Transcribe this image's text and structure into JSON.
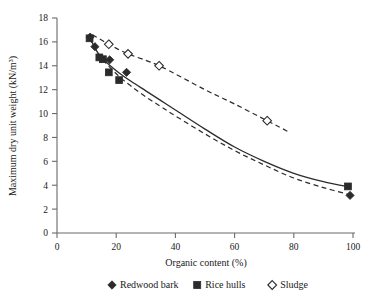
{
  "chart_data": {
    "type": "scatter",
    "title": "",
    "xlabel": "Organic content (%)",
    "ylabel": "Maximum dry unit weight (kN/m³)",
    "xlim": [
      0,
      100
    ],
    "ylim": [
      0,
      18
    ],
    "xticks": [
      0,
      20,
      40,
      60,
      80,
      100
    ],
    "yticks": [
      0,
      2,
      4,
      6,
      8,
      10,
      12,
      14,
      16,
      18
    ],
    "grid": false,
    "legend_position": "bottom",
    "series": [
      {
        "name": "Redwood bark",
        "marker": "filled-diamond",
        "color": "#2b2b2b",
        "points": [
          {
            "x": 11.2,
            "y": 16.4
          },
          {
            "x": 12.8,
            "y": 15.6
          },
          {
            "x": 15.0,
            "y": 14.6
          },
          {
            "x": 17.8,
            "y": 14.5
          },
          {
            "x": 23.5,
            "y": 13.45
          },
          {
            "x": 99.0,
            "y": 3.15
          }
        ]
      },
      {
        "name": "Rice hulls",
        "marker": "filled-square",
        "color": "#2b2b2b",
        "points": [
          {
            "x": 11.0,
            "y": 16.3
          },
          {
            "x": 14.3,
            "y": 14.7
          },
          {
            "x": 15.5,
            "y": 14.55
          },
          {
            "x": 17.5,
            "y": 13.45
          },
          {
            "x": 21.0,
            "y": 12.8
          },
          {
            "x": 98.3,
            "y": 3.9
          }
        ]
      },
      {
        "name": "Sludge",
        "marker": "open-diamond",
        "color": "#ffffff",
        "points": [
          {
            "x": 17.5,
            "y": 15.8
          },
          {
            "x": 24.0,
            "y": 15.0
          },
          {
            "x": 34.5,
            "y": 14.0
          },
          {
            "x": 71.0,
            "y": 9.4
          }
        ]
      }
    ],
    "fit_curves": [
      {
        "name": "organics-fit-solid",
        "style": "solid",
        "points": [
          {
            "x": 11.0,
            "y": 16.4
          },
          {
            "x": 13.0,
            "y": 15.4
          },
          {
            "x": 15.0,
            "y": 14.7
          },
          {
            "x": 18.0,
            "y": 14.0
          },
          {
            "x": 21.0,
            "y": 13.4
          },
          {
            "x": 25.0,
            "y": 12.7
          },
          {
            "x": 30.0,
            "y": 11.9
          },
          {
            "x": 35.0,
            "y": 11.1
          },
          {
            "x": 40.0,
            "y": 10.3
          },
          {
            "x": 50.0,
            "y": 8.7
          },
          {
            "x": 60.0,
            "y": 7.2
          },
          {
            "x": 70.0,
            "y": 6.0
          },
          {
            "x": 80.0,
            "y": 5.0
          },
          {
            "x": 90.0,
            "y": 4.3
          },
          {
            "x": 99.0,
            "y": 3.85
          }
        ]
      },
      {
        "name": "organics-fit-dashed",
        "style": "dashed",
        "points": [
          {
            "x": 11.0,
            "y": 16.3
          },
          {
            "x": 14.0,
            "y": 15.0
          },
          {
            "x": 17.0,
            "y": 14.1
          },
          {
            "x": 21.0,
            "y": 13.1
          },
          {
            "x": 25.0,
            "y": 12.3
          },
          {
            "x": 30.0,
            "y": 11.4
          },
          {
            "x": 35.0,
            "y": 10.6
          },
          {
            "x": 40.0,
            "y": 9.8
          },
          {
            "x": 50.0,
            "y": 8.3
          },
          {
            "x": 60.0,
            "y": 6.9
          },
          {
            "x": 70.0,
            "y": 5.7
          },
          {
            "x": 80.0,
            "y": 4.6
          },
          {
            "x": 90.0,
            "y": 3.8
          },
          {
            "x": 99.0,
            "y": 3.2
          }
        ]
      },
      {
        "name": "sludge-fit-dashed",
        "style": "dashed",
        "points": [
          {
            "x": 12.0,
            "y": 16.6
          },
          {
            "x": 17.5,
            "y": 15.8
          },
          {
            "x": 24.0,
            "y": 15.0
          },
          {
            "x": 34.5,
            "y": 14.0
          },
          {
            "x": 50.0,
            "y": 12.0
          },
          {
            "x": 60.0,
            "y": 10.8
          },
          {
            "x": 71.0,
            "y": 9.4
          },
          {
            "x": 78.0,
            "y": 8.5
          }
        ]
      }
    ]
  },
  "axes": {
    "x_title": "Organic content (%)",
    "y_title": "Maximum dry unit weight (kN/m³)",
    "x_tick_labels": [
      "0",
      "20",
      "40",
      "60",
      "80",
      "100"
    ],
    "y_tick_labels": [
      "0",
      "2",
      "4",
      "6",
      "8",
      "10",
      "12",
      "14",
      "16",
      "18"
    ]
  },
  "legend": {
    "items": [
      {
        "label": "Redwood bark",
        "marker": "filled-diamond"
      },
      {
        "label": "Rice hulls",
        "marker": "filled-square"
      },
      {
        "label": "Sludge",
        "marker": "open-diamond"
      }
    ]
  }
}
